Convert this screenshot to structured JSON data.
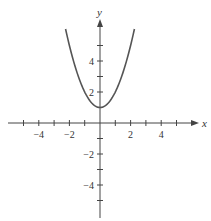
{
  "chart_data": {
    "type": "line",
    "title": "",
    "function": "y = x^2 + 1",
    "xlabel": "x",
    "ylabel": "y",
    "xlim": [
      -6,
      6
    ],
    "ylim": [
      -6,
      6
    ],
    "grid": false,
    "legend": null,
    "x_ticks": [
      -5,
      -4,
      -3,
      -2,
      -1,
      1,
      2,
      3,
      4,
      5
    ],
    "x_tick_labels": [
      {
        "value": -4,
        "label": "−4"
      },
      {
        "value": -2,
        "label": "−2"
      },
      {
        "value": 2,
        "label": "2"
      },
      {
        "value": 4,
        "label": "4"
      }
    ],
    "y_ticks": [
      -5,
      -4,
      -3,
      -2,
      -1,
      1,
      2,
      3,
      4,
      5
    ],
    "y_tick_labels": [
      {
        "value": 4,
        "label": "4"
      },
      {
        "value": 2,
        "label": "2"
      },
      {
        "value": -2,
        "label": "−2"
      },
      {
        "value": -4,
        "label": "−4"
      }
    ],
    "series": [
      {
        "name": "parabola",
        "x": [
          -2.25,
          -2,
          -1.5,
          -1,
          -0.5,
          0,
          0.5,
          1,
          1.5,
          2,
          2.25
        ],
        "y": [
          6.06,
          5,
          3.25,
          2,
          1.25,
          1,
          1.25,
          2,
          3.25,
          5,
          6.06
        ],
        "color": "#555555"
      }
    ],
    "vertex": {
      "x": 0,
      "y": 1
    }
  },
  "colors": {
    "axis": "#444444",
    "curve": "#555555",
    "text": "#333333"
  }
}
